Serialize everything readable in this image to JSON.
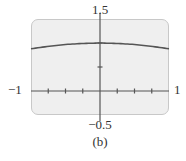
{
  "chart_data": {
    "type": "line",
    "title": "",
    "caption": "(b)",
    "xlabel": "",
    "ylabel": "",
    "xlim": [
      -1,
      1
    ],
    "ylim": [
      -0.5,
      1.5
    ],
    "x_tick_labels": {
      "min": "−1",
      "max": "1"
    },
    "y_tick_labels": {
      "min": "−0.5",
      "max": "1.5"
    },
    "x_ticks": [
      -0.75,
      -0.5,
      -0.25,
      0,
      0.25,
      0.5,
      0.75
    ],
    "y_ticks": [
      0.5,
      1
    ],
    "grid": false,
    "legend": null,
    "series": [
      {
        "name": "curve",
        "x": [
          -1,
          -0.75,
          -0.5,
          -0.25,
          0,
          0.25,
          0.5,
          0.75,
          1
        ],
        "values": [
          0.88,
          0.93,
          0.97,
          0.99,
          1.0,
          0.99,
          0.97,
          0.93,
          0.88
        ]
      }
    ]
  },
  "labels": {
    "y_max": "1.5",
    "y_min": "−0.5",
    "x_min": "−1",
    "x_max": "1",
    "caption": "(b)"
  },
  "colors": {
    "screen_bg": "#efefef",
    "frame_border": "#c8c8c8",
    "axis": "#555555",
    "curve": "#555555"
  }
}
